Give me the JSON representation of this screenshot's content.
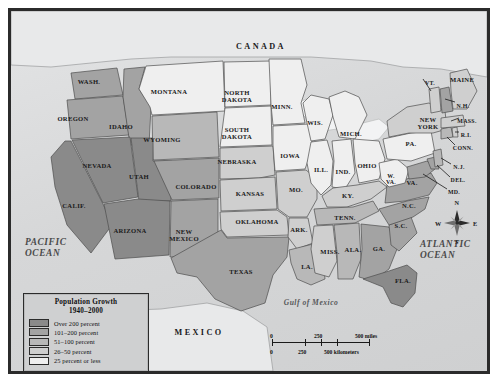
{
  "labels": {
    "canada": "CANADA",
    "mexico": "MEXICO",
    "pacific_ocean": "PACIFIC\nOCEAN",
    "pacific_line1": "PACIFIC",
    "pacific_line2": "OCEAN",
    "atlantic_line1": "ATLANTIC",
    "atlantic_line2": "OCEAN",
    "gulf": "Gulf of Mexico"
  },
  "legend": {
    "title_line1": "Population Growth",
    "title_line2": "1940–2000",
    "entries": [
      {
        "label": "Over 200 percent",
        "color": "#8a8a8a"
      },
      {
        "label": "101–200 percent",
        "color": "#a3a3a3"
      },
      {
        "label": "51–100 percent",
        "color": "#b8b8b8"
      },
      {
        "label": "26–50 percent",
        "color": "#cfcfcf"
      },
      {
        "label": "25 percent or less",
        "color": "#efefef"
      }
    ]
  },
  "scale_bar": {
    "miles": {
      "start": "0",
      "mid": "250",
      "end": "500 miles"
    },
    "kilometers": {
      "start": "0",
      "mid": "250",
      "end": "500 kilometers"
    }
  },
  "compass": {
    "north": "N",
    "east": "E",
    "south": "S",
    "west": "W"
  },
  "chart_data": {
    "type": "map",
    "title": "Population Growth 1940–2000",
    "legend_position": "bottom-left",
    "color_scale": [
      "#8a8a8a",
      "#a3a3a3",
      "#b8b8b8",
      "#cfcfcf",
      "#efefef"
    ],
    "categories": [
      "Over 200 percent",
      "101–200 percent",
      "51–100 percent",
      "26–50 percent",
      "25 percent or less"
    ],
    "regions": [
      {
        "name": "WASH.",
        "category": "101–200 percent"
      },
      {
        "name": "OREGON",
        "category": "101–200 percent"
      },
      {
        "name": "IDAHO",
        "category": "101–200 percent"
      },
      {
        "name": "MONTANA",
        "category": "25 percent or less"
      },
      {
        "name": "WYOMING",
        "category": "51–100 percent"
      },
      {
        "name": "NEVADA",
        "category": "Over 200 percent"
      },
      {
        "name": "UTAH",
        "category": "Over 200 percent"
      },
      {
        "name": "CALIF.",
        "category": "Over 200 percent"
      },
      {
        "name": "ARIZONA",
        "category": "Over 200 percent"
      },
      {
        "name": "NEW MEXICO",
        "category": "101–200 percent"
      },
      {
        "name": "COLORADO",
        "category": "101–200 percent"
      },
      {
        "name": "NORTH DAKOTA",
        "category": "25 percent or less"
      },
      {
        "name": "SOUTH DAKOTA",
        "category": "25 percent or less"
      },
      {
        "name": "NEBRASKA",
        "category": "26–50 percent"
      },
      {
        "name": "KANSAS",
        "category": "26–50 percent"
      },
      {
        "name": "OKLAHOMA",
        "category": "26–50 percent"
      },
      {
        "name": "TEXAS",
        "category": "101–200 percent"
      },
      {
        "name": "MINN.",
        "category": "25 percent or less"
      },
      {
        "name": "IOWA",
        "category": "25 percent or less"
      },
      {
        "name": "MO.",
        "category": "26–50 percent"
      },
      {
        "name": "ARK.",
        "category": "26–50 percent"
      },
      {
        "name": "LA.",
        "category": "51–100 percent"
      },
      {
        "name": "WIS.",
        "category": "25 percent or less"
      },
      {
        "name": "ILL.",
        "category": "25 percent or less"
      },
      {
        "name": "MICH.",
        "category": "25 percent or less"
      },
      {
        "name": "IND.",
        "category": "25 percent or less"
      },
      {
        "name": "OHIO",
        "category": "25 percent or less"
      },
      {
        "name": "KY.",
        "category": "26–50 percent"
      },
      {
        "name": "TENN.",
        "category": "51–100 percent"
      },
      {
        "name": "MISS.",
        "category": "26–50 percent"
      },
      {
        "name": "ALA.",
        "category": "51–100 percent"
      },
      {
        "name": "GA.",
        "category": "101–200 percent"
      },
      {
        "name": "FLA.",
        "category": "Over 200 percent"
      },
      {
        "name": "S.C.",
        "category": "101–200 percent"
      },
      {
        "name": "N.C.",
        "category": "101–200 percent"
      },
      {
        "name": "VA.",
        "category": "101–200 percent"
      },
      {
        "name": "W. VA.",
        "category": "25 percent or less"
      },
      {
        "name": "MD.",
        "category": "101–200 percent"
      },
      {
        "name": "DEL.",
        "category": "101–200 percent"
      },
      {
        "name": "PA.",
        "category": "25 percent or less"
      },
      {
        "name": "N.J.",
        "category": "51–100 percent"
      },
      {
        "name": "NEW YORK",
        "category": "26–50 percent"
      },
      {
        "name": "CONN.",
        "category": "51–100 percent"
      },
      {
        "name": "R.I.",
        "category": "26–50 percent"
      },
      {
        "name": "MASS.",
        "category": "26–50 percent"
      },
      {
        "name": "VT.",
        "category": "26–50 percent"
      },
      {
        "name": "N.H.",
        "category": "101–200 percent"
      },
      {
        "name": "MAINE",
        "category": "26–50 percent"
      }
    ]
  },
  "states": [
    {
      "abbr": "WASH.",
      "name": "WASH.",
      "x": 78,
      "y": 72,
      "size": "st"
    },
    {
      "abbr": "OREGON",
      "name": "OREGON",
      "x": 62,
      "y": 109,
      "size": "st"
    },
    {
      "abbr": "IDAHO",
      "name": "IDAHO",
      "x": 110,
      "y": 117,
      "size": "st"
    },
    {
      "abbr": "MONTANA",
      "name": "MONTANA",
      "x": 158,
      "y": 82,
      "size": "st"
    },
    {
      "abbr": "WYOMING",
      "name": "WYOMING",
      "x": 151,
      "y": 130,
      "size": "st"
    },
    {
      "abbr": "NEVADA",
      "name": "NEVADA",
      "x": 86,
      "y": 156,
      "size": "st"
    },
    {
      "abbr": "UTAH",
      "name": "UTAH",
      "x": 128,
      "y": 167,
      "size": "st"
    },
    {
      "abbr": "CALIF.",
      "name": "CALIF.",
      "x": 63,
      "y": 196,
      "size": "st"
    },
    {
      "abbr": "ARIZONA",
      "name": "ARIZONA",
      "x": 119,
      "y": 221,
      "size": "st"
    },
    {
      "abbr": "NEW MEXICO",
      "name": "NEW\nMEXICO",
      "x": 173,
      "y": 222,
      "size": "st"
    },
    {
      "abbr": "COLORADO",
      "name": "COLORADO",
      "x": 185,
      "y": 177,
      "size": "st"
    },
    {
      "abbr": "NORTH DAKOTA",
      "name": "NORTH\nDAKOTA",
      "x": 226,
      "y": 83,
      "size": "st"
    },
    {
      "abbr": "SOUTH DAKOTA",
      "name": "SOUTH\nDAKOTA",
      "x": 226,
      "y": 120,
      "size": "st"
    },
    {
      "abbr": "NEBRASKA",
      "name": "NEBRASKA",
      "x": 226,
      "y": 152,
      "size": "st"
    },
    {
      "abbr": "KANSAS",
      "name": "KANSAS",
      "x": 239,
      "y": 184,
      "size": "st"
    },
    {
      "abbr": "OKLAHOMA",
      "name": "OKLAHOMA",
      "x": 246,
      "y": 212,
      "size": "st"
    },
    {
      "abbr": "TEXAS",
      "name": "TEXAS",
      "x": 230,
      "y": 262,
      "size": "st"
    },
    {
      "abbr": "MINN.",
      "name": "MINN.",
      "x": 271,
      "y": 97,
      "size": "st"
    },
    {
      "abbr": "IOWA",
      "name": "IOWA",
      "x": 279,
      "y": 146,
      "size": "st"
    },
    {
      "abbr": "MO.",
      "name": "MO.",
      "x": 285,
      "y": 180,
      "size": "st"
    },
    {
      "abbr": "ARK.",
      "name": "ARK.",
      "x": 288,
      "y": 220,
      "size": "st"
    },
    {
      "abbr": "LA.",
      "name": "LA.",
      "x": 296,
      "y": 257,
      "size": "st"
    },
    {
      "abbr": "WIS.",
      "name": "WIS.",
      "x": 304,
      "y": 113,
      "size": "st"
    },
    {
      "abbr": "ILL.",
      "name": "ILL.",
      "x": 310,
      "y": 160,
      "size": "st"
    },
    {
      "abbr": "MICH.",
      "name": "MICH.",
      "x": 340,
      "y": 124,
      "size": "st"
    },
    {
      "abbr": "IND.",
      "name": "IND.",
      "x": 332,
      "y": 162,
      "size": "st"
    },
    {
      "abbr": "OHIO",
      "name": "OHIO",
      "x": 356,
      "y": 156,
      "size": "st"
    },
    {
      "abbr": "KY.",
      "name": "KY.",
      "x": 337,
      "y": 186,
      "size": "st"
    },
    {
      "abbr": "TENN.",
      "name": "TENN.",
      "x": 334,
      "y": 208,
      "size": "st"
    },
    {
      "abbr": "MISS.",
      "name": "MISS.",
      "x": 319,
      "y": 242,
      "size": "st"
    },
    {
      "abbr": "ALA.",
      "name": "ALA.",
      "x": 342,
      "y": 240,
      "size": "st"
    },
    {
      "abbr": "GA.",
      "name": "GA.",
      "x": 368,
      "y": 239,
      "size": "st"
    },
    {
      "abbr": "FLA.",
      "name": "FLA.",
      "x": 392,
      "y": 271,
      "size": "st"
    },
    {
      "abbr": "S.C.",
      "name": "S.C.",
      "x": 390,
      "y": 216,
      "size": "st"
    },
    {
      "abbr": "N.C.",
      "name": "N.C.",
      "x": 398,
      "y": 196,
      "size": "st"
    },
    {
      "abbr": "VA.",
      "name": "VA.",
      "x": 401,
      "y": 173,
      "size": "st"
    },
    {
      "abbr": "W. VA.",
      "name": "W.\nVA.",
      "x": 380,
      "y": 166,
      "size": "sm"
    },
    {
      "abbr": "PA.",
      "name": "PA.",
      "x": 400,
      "y": 134,
      "size": "st"
    },
    {
      "abbr": "NEW YORK",
      "name": "NEW\nYORK",
      "x": 417,
      "y": 110,
      "size": "st"
    },
    {
      "abbr": "VT.",
      "name": "VT.",
      "x": 419,
      "y": 73,
      "size": "sm"
    },
    {
      "abbr": "MAINE",
      "name": "MAINE",
      "x": 451,
      "y": 70,
      "size": "st"
    },
    {
      "abbr": "N.H.",
      "name": "N.H.",
      "x": 452,
      "y": 96,
      "size": "sm"
    },
    {
      "abbr": "MASS.",
      "name": "MASS.",
      "x": 456,
      "y": 111,
      "size": "sm"
    },
    {
      "abbr": "R.I.",
      "name": "R.I.",
      "x": 455,
      "y": 125,
      "size": "sm"
    },
    {
      "abbr": "CONN.",
      "name": "CONN.",
      "x": 452,
      "y": 138,
      "size": "sm"
    },
    {
      "abbr": "N.J.",
      "name": "N.J.",
      "x": 448,
      "y": 157,
      "size": "sm"
    },
    {
      "abbr": "DEL.",
      "name": "DEL.",
      "x": 447,
      "y": 170,
      "size": "sm"
    },
    {
      "abbr": "MD.",
      "name": "MD.",
      "x": 443,
      "y": 182,
      "size": "sm"
    }
  ]
}
